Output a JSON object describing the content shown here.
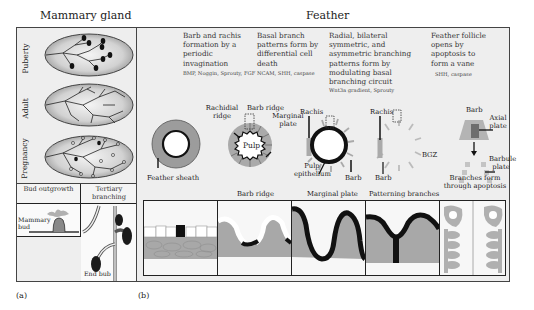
{
  "titles": {
    "mammary": "Mammary gland",
    "feather": "Feather"
  },
  "mammary": {
    "stages": [
      {
        "label": "Puberty"
      },
      {
        "label": "Adult"
      },
      {
        "label": "Pregnancy"
      }
    ],
    "bottom": {
      "bud_header": "Bud outgrowth",
      "tertiary_header": "Tertiary branching",
      "mammary_bud_label": "Mammary bud",
      "end_bud_label": "End bub"
    },
    "panel_label": "(a)"
  },
  "feather": {
    "panel_label": "(b)",
    "columns": [
      {
        "description": "Barb and rachis formation by a periodic invagination",
        "genes": "BMP, Noggin, Sprouty, FGF"
      },
      {
        "description": "Basal branch patterns form by differential cell death",
        "genes": "NCAM, SHH, caspase"
      },
      {
        "description": "Radial, bilateral symmetric, and asymmetric branching patterns form by modulating basal branching circuit",
        "genes": "Wnt3a gradient, Sprouty"
      },
      {
        "description": "Feather follicle opens by apoptosis to form a vane",
        "genes": "SHH, caspase"
      }
    ],
    "cross_sections": {
      "feather_sheath": "Feather sheath",
      "rachidial_ridge": "Rachidial ridge",
      "barb_ridge": "Barb ridge",
      "marginal_plate": "Marginal plate",
      "pulp": "Pulp",
      "rachis_1": "Rachis",
      "pulp_epithelium": "Pulp epithelium",
      "barb_1": "Barb",
      "rachis_2": "Rachis",
      "bgz": "BGZ",
      "barb_2": "Barb",
      "barb_3": "Barb",
      "axial_plate": "Axial plate",
      "barbule_plate": "Barbule plate",
      "branches_apoptosis": "Branches form through apoptosis"
    },
    "strip_labels": [
      "",
      "Barb ridge",
      "Marginal plate",
      "Patterning branches",
      ""
    ],
    "colors": {
      "gray_tissue": "#a8a8a8",
      "dark": "#1a1a1a",
      "panel_bg": "#eeeeee"
    }
  }
}
